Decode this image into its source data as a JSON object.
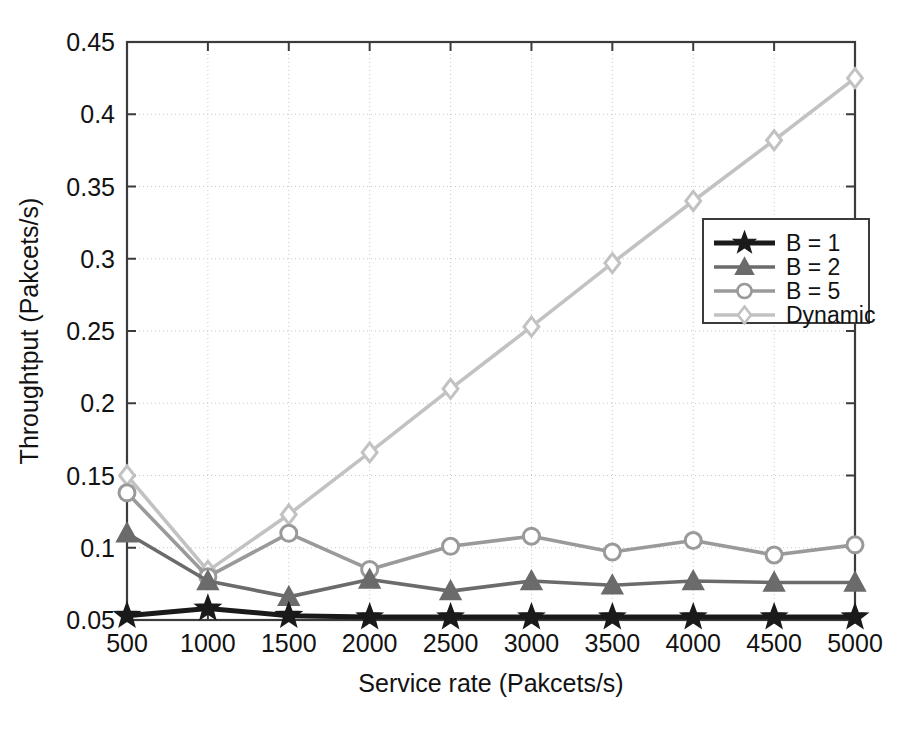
{
  "chart_data": {
    "type": "line",
    "title": "",
    "xlabel": "Service rate (Pakcets/s)",
    "ylabel": "Throughtput (Pakcets/s)",
    "x": [
      500,
      1000,
      1500,
      2000,
      2500,
      3000,
      3500,
      4000,
      4500,
      5000
    ],
    "xticklabels": [
      "500",
      "1000",
      "1500",
      "2000",
      "2500",
      "3000",
      "3500",
      "4000",
      "4500",
      "5000"
    ],
    "yticklabels": [
      "0.05",
      "0.1",
      "0.15",
      "0.2",
      "0.25",
      "0.3",
      "0.35",
      "0.4",
      "0.45"
    ],
    "yticks": [
      0.05,
      0.1,
      0.15,
      0.2,
      0.25,
      0.3,
      0.35,
      0.4,
      0.45
    ],
    "xlim": [
      500,
      5000
    ],
    "ylim": [
      0.05,
      0.45
    ],
    "grid": true,
    "legend_position": "center-right",
    "series": [
      {
        "name": "B = 1",
        "marker": "star",
        "color": "#1a1a1a",
        "values": [
          0.053,
          0.058,
          0.053,
          0.052,
          0.052,
          0.052,
          0.052,
          0.052,
          0.052,
          0.052
        ]
      },
      {
        "name": "B = 2",
        "marker": "triangle",
        "color": "#6b6b6b",
        "values": [
          0.11,
          0.077,
          0.066,
          0.078,
          0.07,
          0.077,
          0.074,
          0.077,
          0.076,
          0.076
        ]
      },
      {
        "name": "B = 5",
        "marker": "circle",
        "color": "#9a9a9a",
        "values": [
          0.138,
          0.08,
          0.11,
          0.085,
          0.101,
          0.108,
          0.097,
          0.105,
          0.095,
          0.102
        ]
      },
      {
        "name": "Dynamic",
        "marker": "diamond",
        "color": "#c2c2c2",
        "values": [
          0.15,
          0.084,
          0.123,
          0.166,
          0.21,
          0.253,
          0.297,
          0.34,
          0.382,
          0.425
        ]
      }
    ]
  },
  "legend": {
    "entries": [
      {
        "label": "B = 1"
      },
      {
        "label": "B = 2"
      },
      {
        "label": "B = 5"
      },
      {
        "label": "Dynamic"
      }
    ]
  },
  "axes": {
    "x_title": "Service rate (Pakcets/s)",
    "y_title": "Throughtput (Pakcets/s)",
    "x_ticks": [
      "500",
      "1000",
      "1500",
      "2000",
      "2500",
      "3000",
      "3500",
      "4000",
      "4500",
      "5000"
    ],
    "y_ticks": [
      "0.05",
      "0.1",
      "0.15",
      "0.2",
      "0.25",
      "0.3",
      "0.35",
      "0.4",
      "0.45"
    ]
  },
  "colors": {
    "b1": "#1a1a1a",
    "b2": "#6b6b6b",
    "b5": "#9a9a9a",
    "dynamic": "#c2c2c2",
    "axis": "#3b3b3b",
    "grid": "#c8c8c8",
    "background": "#ffffff"
  }
}
